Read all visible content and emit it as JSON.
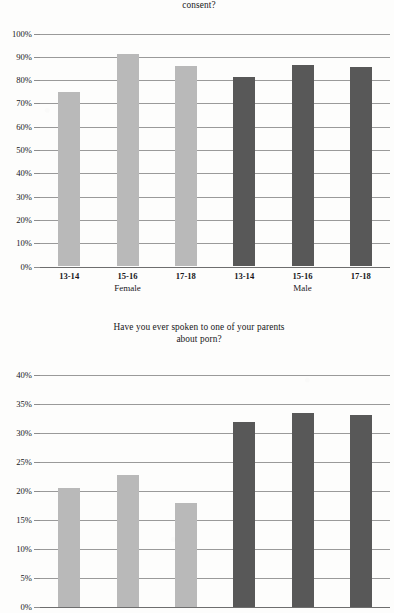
{
  "page": {
    "background_color": "#fdfdfc",
    "text_color": "#1c1c1c"
  },
  "colors": {
    "female_bar": "#b9b9b9",
    "male_bar": "#585858",
    "gridline": "#9a9a9a",
    "axis": "#6e6e6e"
  },
  "chart_data": [
    {
      "id": "chart-top",
      "type": "bar",
      "title": "consent?",
      "title_lines": [
        "consent?"
      ],
      "title_note": "First line of the title is cropped off the top edge of the page; only the final word is visible.",
      "xlabel": "",
      "ylabel": "",
      "ylim": [
        0,
        100
      ],
      "ytick_labels": [
        "100%",
        "90%",
        "80%",
        "70%",
        "60%",
        "50%",
        "40%",
        "30%",
        "20%",
        "10%",
        "0%"
      ],
      "ytick_values": [
        100,
        90,
        80,
        70,
        60,
        50,
        40,
        30,
        20,
        10,
        0
      ],
      "grid": true,
      "legend": "none",
      "categories": [
        "13-14",
        "15-16",
        "17-18",
        "13-14",
        "15-16",
        "17-18"
      ],
      "groups": [
        {
          "label": "Female",
          "categories": [
            "13-14",
            "15-16",
            "17-18"
          ],
          "values": [
            74.8,
            91.0,
            86.0
          ],
          "color": "#b9b9b9"
        },
        {
          "label": "Male",
          "categories": [
            "13-14",
            "15-16",
            "17-18"
          ],
          "values": [
            81.5,
            86.5,
            85.5
          ],
          "color": "#585858"
        }
      ],
      "values": [
        74.8,
        91.0,
        86.0,
        81.5,
        86.5,
        85.5
      ]
    },
    {
      "id": "chart-bottom",
      "type": "bar",
      "title": "Have you ever spoken to one of your parents about porn?",
      "title_lines": [
        "Have you ever spoken to one of your parents",
        "about porn?"
      ],
      "xlabel": "",
      "ylabel": "",
      "ylim": [
        0,
        40
      ],
      "ytick_labels": [
        "40%",
        "35%",
        "30%",
        "25%",
        "20%",
        "15%",
        "10%",
        "5%",
        "0%"
      ],
      "ytick_values": [
        40,
        35,
        30,
        25,
        20,
        15,
        10,
        5,
        0
      ],
      "grid": true,
      "legend": "none",
      "categories": [
        "13-14",
        "15-16",
        "17-18",
        "13-14",
        "15-16",
        "17-18"
      ],
      "groups": [
        {
          "label": "Female",
          "categories": [
            "13-14",
            "15-16",
            "17-18"
          ],
          "values": [
            20.5,
            22.7,
            17.9
          ],
          "color": "#b9b9b9"
        },
        {
          "label": "Male",
          "categories": [
            "13-14",
            "15-16",
            "17-18"
          ],
          "values": [
            31.9,
            33.5,
            33.1
          ],
          "color": "#585858"
        }
      ],
      "values": [
        20.5,
        22.7,
        17.9,
        31.9,
        33.5,
        33.1
      ]
    }
  ]
}
